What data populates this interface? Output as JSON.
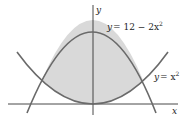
{
  "figure": {
    "axes": {
      "x_label": "x",
      "y_label": "y"
    },
    "curves": [
      {
        "name": "upper-parabola",
        "label_lhs": "y",
        "label_rhs": "= 12 − 2x",
        "label_exp": "2",
        "equation": "y = 12 - 2x^2"
      },
      {
        "name": "lower-parabola",
        "label_lhs": "y",
        "label_rhs": "= x",
        "label_exp": "2",
        "equation": "y = x^2"
      }
    ],
    "region": {
      "description": "Shaded region bounded between y = x^2 (below) and y = 12 - 2x^2 (above)",
      "fill_color": "#d9d9d9"
    },
    "colors": {
      "curve": "#6a6a6a",
      "axis": "#333333",
      "background": "#ffffff"
    }
  }
}
